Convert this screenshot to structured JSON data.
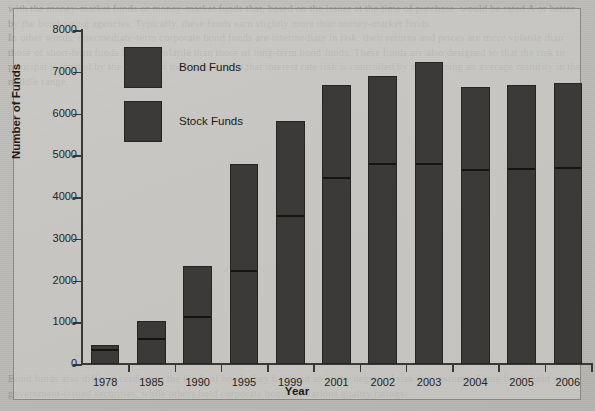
{
  "figure": {
    "background_color": "#cecdc9",
    "bar_color": "#3b3a38",
    "axis_color": "#3a3937"
  },
  "page_text": {
    "top": "with the money-market funds or money-market funds that, based on the issuer at the time of purchase, would be rated A or better by the bond-rating agencies. Typically, these funds earn slightly more than money-market funds.\nIn other words, intermediate-term corporate bond funds are intermediate in risk: their returns and prices are more volatile than those of short-term funds but less volatile than those of long-term bond funds. These funds are also designed so that the risk to principal is limited by the quality of the issues and so that interest rate risk is controlled by maintaining an average maturity in the middle range.",
    "bottom": "Bond funds also differ according to the kinds of bonds they hold and so in the degree of risk they assume. Some funds hold only government-issued securities, while others hold corporate bonds of various quality ratings."
  },
  "legend": {
    "items": [
      {
        "label": "Bond Funds",
        "color": "#3b3a38"
      },
      {
        "label": "Stock Funds",
        "color": "#3b3a38"
      }
    ]
  },
  "chart_data": {
    "type": "bar",
    "title": "",
    "subtitle": "",
    "xlabel": "Year",
    "ylabel": "Number of Funds",
    "ylim": [
      0,
      8000
    ],
    "ytick_labels": [
      "0",
      "1000",
      "2000",
      "3000",
      "4000",
      "5000",
      "6000",
      "7000",
      "8000"
    ],
    "yticks": [
      0,
      1000,
      2000,
      3000,
      4000,
      5000,
      6000,
      7000,
      8000
    ],
    "grid": false,
    "stacked": true,
    "legend_position": "upper-left-inside",
    "categories": [
      "1978",
      "1985",
      "1990",
      "1995",
      "1999",
      "2001",
      "2002",
      "2003",
      "2004",
      "2005",
      "2006"
    ],
    "series": [
      {
        "name": "Stock Funds",
        "values": [
          280,
          550,
          1070,
          2180,
          3500,
          4410,
          4750,
          4740,
          4600,
          4620,
          4650
        ]
      },
      {
        "name": "Bond Funds",
        "values": [
          170,
          480,
          1280,
          2610,
          2320,
          2270,
          2160,
          2490,
          2040,
          2060,
          2080
        ]
      }
    ],
    "totals": [
      450,
      1030,
      2350,
      4790,
      5820,
      6680,
      6910,
      7230,
      6640,
      6680,
      6730
    ]
  }
}
